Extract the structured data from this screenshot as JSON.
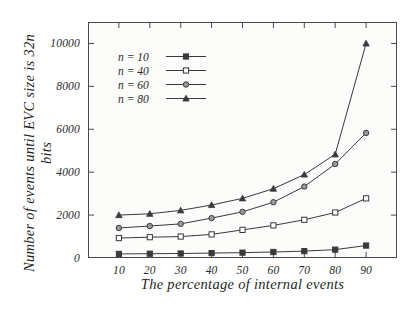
{
  "chart_data": {
    "type": "line",
    "title": "",
    "xlabel": "The percentage of internal events",
    "ylabel": "Number of events until EVC size is 32n bits",
    "x": [
      10,
      20,
      30,
      40,
      50,
      60,
      70,
      80,
      90
    ],
    "xlim": [
      0,
      100
    ],
    "ylim": [
      0,
      11000
    ],
    "xticks": [
      "10",
      "20",
      "30",
      "40",
      "50",
      "60",
      "70",
      "80",
      "90"
    ],
    "yticks": [
      "0",
      "2000",
      "4000",
      "6000",
      "8000",
      "10000"
    ],
    "grid": false,
    "legend_position": "upper left",
    "series": [
      {
        "name": "n = 10",
        "marker": "filled-square",
        "color": "#3a3a3a",
        "values": [
          190,
          200,
          210,
          230,
          250,
          280,
          320,
          390,
          580
        ]
      },
      {
        "name": "n = 40",
        "marker": "open-square",
        "color": "#3a3a3a",
        "values": [
          930,
          970,
          1000,
          1100,
          1310,
          1520,
          1780,
          2120,
          2780
        ]
      },
      {
        "name": "n = 60",
        "marker": "circle",
        "color": "#3a3a3a",
        "values": [
          1400,
          1490,
          1590,
          1860,
          2150,
          2600,
          3330,
          4380,
          5830
        ]
      },
      {
        "name": "n = 80",
        "marker": "filled-triangle",
        "color": "#3a3a3a",
        "values": [
          2000,
          2060,
          2220,
          2470,
          2780,
          3230,
          3890,
          4830,
          10000
        ]
      }
    ]
  },
  "legend": {
    "items": [
      {
        "label": "n = 10"
      },
      {
        "label": "n = 40"
      },
      {
        "label": "n = 60"
      },
      {
        "label": "n = 80"
      }
    ]
  }
}
